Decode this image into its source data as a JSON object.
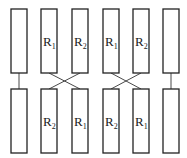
{
  "diagram": {
    "colors": {
      "stroke": "#222222",
      "background": "#ffffff"
    },
    "top_row": [
      {
        "id": "A",
        "label": "",
        "subscript": ""
      },
      {
        "id": "B",
        "label": "R",
        "subscript": "1"
      },
      {
        "id": "C",
        "label": "R",
        "subscript": "2"
      },
      {
        "id": "D",
        "label": "R",
        "subscript": "1"
      },
      {
        "id": "E",
        "label": "R",
        "subscript": "2"
      },
      {
        "id": "F",
        "label": "",
        "subscript": ""
      }
    ],
    "bottom_row": [
      {
        "id": "A",
        "label": "",
        "subscript": ""
      },
      {
        "id": "B",
        "label": "R",
        "subscript": "2"
      },
      {
        "id": "C",
        "label": "R",
        "subscript": "1"
      },
      {
        "id": "D",
        "label": "R",
        "subscript": "2"
      },
      {
        "id": "E",
        "label": "R",
        "subscript": "1"
      },
      {
        "id": "F",
        "label": "",
        "subscript": ""
      }
    ],
    "connections": [
      {
        "type": "straight",
        "columns": [
          "A"
        ]
      },
      {
        "type": "cross",
        "columns": [
          "B",
          "C"
        ]
      },
      {
        "type": "cross",
        "columns": [
          "D",
          "E"
        ]
      },
      {
        "type": "straight",
        "columns": [
          "F"
        ]
      }
    ]
  }
}
